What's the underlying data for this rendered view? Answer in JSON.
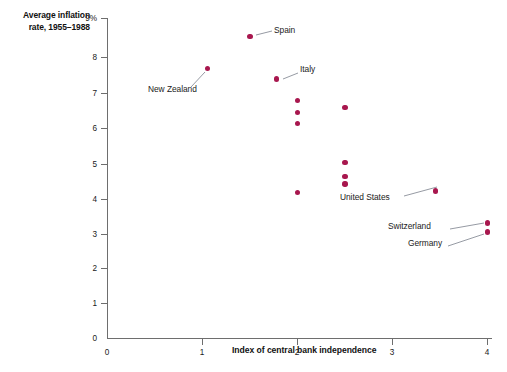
{
  "chart_data": {
    "type": "scatter",
    "title": "",
    "ylabel": "Average inflation rate, 1955–1988",
    "xlabel": "Index of central bank independence",
    "xlim": [
      0,
      4
    ],
    "ylim": [
      0,
      9
    ],
    "xticks": [
      "0",
      "1",
      "2",
      "3",
      "4"
    ],
    "yticks": [
      "0",
      "1",
      "2",
      "3",
      "4",
      "5",
      "6",
      "7",
      "8",
      "9%"
    ],
    "grid": false,
    "legend": null,
    "marker_color": "#a8174e",
    "points": [
      {
        "x": 1.5,
        "y": 8.5,
        "label": "Spain"
      },
      {
        "x": 1.05,
        "y": 7.6,
        "label": "New Zealand"
      },
      {
        "x": 1.78,
        "y": 7.3,
        "label": "Italy"
      },
      {
        "x": 2.0,
        "y": 6.7,
        "label": ""
      },
      {
        "x": 2.0,
        "y": 6.35,
        "label": ""
      },
      {
        "x": 2.0,
        "y": 6.05,
        "label": ""
      },
      {
        "x": 2.5,
        "y": 6.5,
        "label": ""
      },
      {
        "x": 2.5,
        "y": 4.95,
        "label": ""
      },
      {
        "x": 2.5,
        "y": 4.55,
        "label": ""
      },
      {
        "x": 2.5,
        "y": 4.35,
        "label": ""
      },
      {
        "x": 2.0,
        "y": 4.1,
        "label": ""
      },
      {
        "x": 3.45,
        "y": 4.15,
        "label": "United States"
      },
      {
        "x": 4.0,
        "y": 3.25,
        "label": "Switzerland"
      },
      {
        "x": 4.0,
        "y": 3.0,
        "label": "Germany"
      }
    ],
    "annotations": [
      {
        "text": "Spain",
        "anchor": "right"
      },
      {
        "text": "New Zealand",
        "anchor": "below-left"
      },
      {
        "text": "Italy",
        "anchor": "right"
      },
      {
        "text": "United States",
        "anchor": "below-left"
      },
      {
        "text": "Switzerland",
        "anchor": "left"
      },
      {
        "text": "Germany",
        "anchor": "left"
      }
    ]
  },
  "axes": {
    "y_title": "Average inflation rate, 1955–1988",
    "y_title_line1": "Average inflation",
    "y_title_line2": "rate, 1955–1988",
    "x_title": "Index of central bank independence",
    "y_ticks": [
      {
        "value": "9%",
        "py": 18
      },
      {
        "value": "8",
        "py": 57
      },
      {
        "value": "7",
        "py": 93
      },
      {
        "value": "6",
        "py": 128
      },
      {
        "value": "5",
        "py": 164
      },
      {
        "value": "4",
        "py": 199
      },
      {
        "value": "3",
        "py": 234
      },
      {
        "value": "2",
        "py": 268
      },
      {
        "value": "1",
        "py": 303
      },
      {
        "value": "0",
        "py": 338
      }
    ],
    "x_ticks": [
      {
        "value": "0",
        "px": 107
      },
      {
        "value": "1",
        "px": 202
      },
      {
        "value": "2",
        "px": 297
      },
      {
        "value": "3",
        "px": 392
      },
      {
        "value": "4",
        "px": 487
      }
    ]
  },
  "labels": {
    "spain": "Spain",
    "new_zealand": "New Zealand",
    "italy": "Italy",
    "united_states": "United States",
    "switzerland": "Switzerland",
    "germany": "Germany"
  }
}
